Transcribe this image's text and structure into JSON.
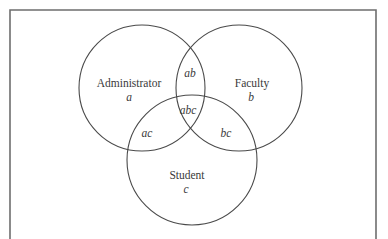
{
  "diagram": {
    "type": "venn",
    "frame": {
      "stroke": "#6e6e6e",
      "left": 10,
      "top": 10,
      "right": 376
    },
    "stroke_color": "#4a4a4a",
    "sets": [
      {
        "id": "a",
        "name": "Administrator",
        "symbol": "a",
        "cx": 142,
        "cy": 88,
        "r": 63
      },
      {
        "id": "b",
        "name": "Faculty",
        "symbol": "b",
        "cx": 239,
        "cy": 88,
        "r": 63
      },
      {
        "id": "c",
        "name": "Student",
        "symbol": "c",
        "cx": 192,
        "cy": 160,
        "r": 65
      }
    ],
    "regions": {
      "ab": "ab",
      "abc": "abc",
      "ac": "ac",
      "bc": "bc"
    }
  }
}
